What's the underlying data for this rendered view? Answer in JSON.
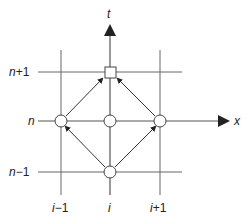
{
  "diagram": {
    "axes": {
      "t_label": "t",
      "x_label": "x"
    },
    "row_labels": [
      {
        "id": "n_plus_1",
        "text_var": "n",
        "text_rest": "+1",
        "y": 72
      },
      {
        "id": "n",
        "text_var": "n",
        "text_rest": "",
        "y": 121
      },
      {
        "id": "n_minus_1",
        "text_var": "n",
        "text_rest": "−1",
        "y": 172
      }
    ],
    "col_labels": [
      {
        "id": "i_minus_1",
        "text_var": "i",
        "text_rest": "−1",
        "x": 61
      },
      {
        "id": "i",
        "text_var": "i",
        "text_rest": "",
        "x": 110
      },
      {
        "id": "i_plus_1",
        "text_var": "i",
        "text_rest": "+1",
        "x": 160
      }
    ],
    "nodes": [
      {
        "id": "node-i-n-plus-1",
        "shape": "square",
        "col": "i",
        "row": "n+1"
      },
      {
        "id": "node-i-minus-1-n",
        "shape": "circle",
        "col": "i-1",
        "row": "n"
      },
      {
        "id": "node-i-n",
        "shape": "circle",
        "col": "i",
        "row": "n"
      },
      {
        "id": "node-i-plus-1-n",
        "shape": "circle",
        "col": "i+1",
        "row": "n"
      },
      {
        "id": "node-i-n-minus-1",
        "shape": "circle",
        "col": "i",
        "row": "n-1"
      }
    ],
    "arrows": [
      {
        "from": "i-1,n",
        "to": "i,n+1"
      },
      {
        "from": "i+1,n",
        "to": "i,n+1"
      },
      {
        "from": "i,n-1",
        "to": "i-1,n"
      },
      {
        "from": "i,n-1",
        "to": "i+1,n"
      }
    ],
    "colors": {
      "line": "#555555",
      "arrow": "#222222",
      "node_fill": "#ffffff",
      "node_stroke": "#444444"
    }
  }
}
